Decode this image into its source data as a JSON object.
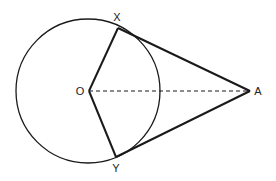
{
  "diagram": {
    "type": "geometry",
    "colors": {
      "stroke": "#1a1a1a",
      "background": "#ffffff"
    },
    "circle": {
      "center_label": "O",
      "cx": 88,
      "cy": 91,
      "r": 72
    },
    "points": {
      "O": {
        "label": "O",
        "x": 89,
        "y": 91
      },
      "X": {
        "label": "X",
        "x": 118,
        "y": 28
      },
      "Y": {
        "label": "Y",
        "x": 116,
        "y": 157
      },
      "A": {
        "label": "A",
        "x": 250,
        "y": 91
      }
    },
    "segments": [
      {
        "from": "O",
        "to": "X",
        "style": "solid",
        "role": "radius"
      },
      {
        "from": "O",
        "to": "Y",
        "style": "solid",
        "role": "radius"
      },
      {
        "from": "X",
        "to": "A",
        "style": "solid",
        "role": "tangent"
      },
      {
        "from": "Y",
        "to": "A",
        "style": "solid",
        "role": "tangent"
      },
      {
        "from": "O",
        "to": "A",
        "style": "dashed",
        "role": "line-of-centers"
      }
    ],
    "labels": {
      "O": "O",
      "X": "X",
      "Y": "Y",
      "A": "A"
    }
  }
}
